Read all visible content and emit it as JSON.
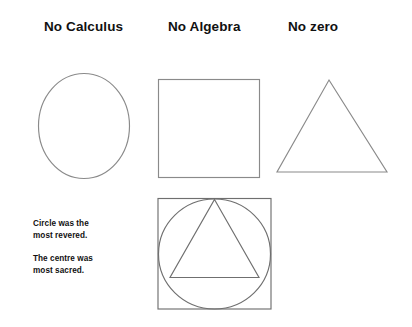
{
  "page": {
    "background_color": "#ffffff",
    "line_color": "#8a8a8a",
    "text_color": "#111111"
  },
  "headings": {
    "calculus": "No Calculus",
    "algebra": "No Algebra",
    "zero": "No zero"
  },
  "captions": {
    "circle_revered": "Circle was the\nmost revered.",
    "centre_sacred": "The centre was\nmost sacred."
  },
  "shapes": {
    "circle": {
      "name": "circle",
      "cx": 46,
      "cy": 53,
      "rx": 46,
      "ry": 53
    },
    "square": {
      "name": "square",
      "x": 2,
      "y": 2,
      "width": 101,
      "height": 99
    },
    "triangle": {
      "name": "triangle",
      "apex_x": 55,
      "apex_y": 4,
      "base_left_x": 3,
      "base_right_x": 113,
      "base_y": 96
    },
    "composite": {
      "name": "square-circle-triangle",
      "square": {
        "x": 3,
        "y": 3,
        "width": 113,
        "height": 111
      },
      "circle": {
        "cx": 59,
        "cy": 58,
        "rx": 56,
        "ry": 55
      },
      "triangle": {
        "apex_x": 59,
        "apex_y": 4,
        "base_left_x": 15,
        "base_right_x": 104,
        "base_y": 82
      }
    }
  }
}
